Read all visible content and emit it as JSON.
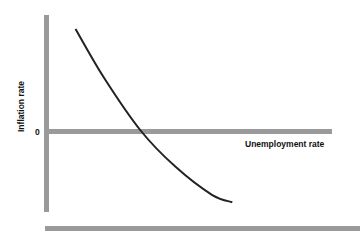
{
  "chart_data": {
    "type": "line",
    "title": "",
    "xlabel": "Unemployment rate",
    "ylabel": "Inflation rate",
    "y_tick_labels": [
      "0"
    ],
    "x_tick_labels": [],
    "xlim": [
      0,
      10
    ],
    "ylim": [
      -5,
      5
    ],
    "grid": false,
    "legend": null,
    "series": [
      {
        "name": "Phillips curve",
        "x": [
          1.0,
          2.0,
          3.3,
          4.5,
          5.8,
          6.5
        ],
        "y": [
          4.6,
          2.4,
          0.0,
          -2.0,
          -3.6,
          -4.0
        ]
      }
    ],
    "colors": {
      "curve": "#222222",
      "axes": "#9a9a9a",
      "text": "#111111"
    }
  }
}
